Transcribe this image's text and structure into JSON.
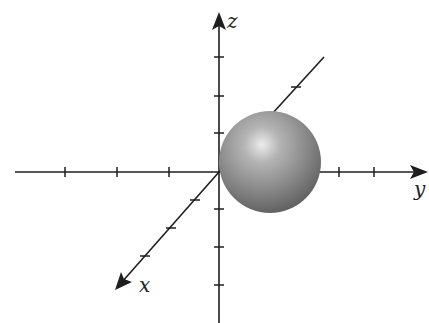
{
  "diagram": {
    "type": "3d-coordinate-axes",
    "labels": {
      "x": "x",
      "y": "y",
      "z": "z"
    },
    "colors": {
      "axis": "#1e1e1e",
      "sphere_highlight": "#e8e8e8",
      "sphere_mid": "#8a8a8a",
      "sphere_shadow": "#5a5a5a",
      "background": "#ffffff"
    },
    "origin": [
      219,
      172
    ],
    "axes": {
      "z": {
        "from": [
          219,
          323
        ],
        "to": [
          219,
          14
        ],
        "ticks_y": [
          57,
          96,
          133,
          209,
          247,
          285
        ]
      },
      "y": {
        "from": [
          15,
          172
        ],
        "to": [
          426,
          172
        ],
        "ticks_x": [
          65,
          117,
          169,
          339,
          374
        ]
      },
      "x": {
        "from": [
          219,
          172
        ],
        "to": [
          117,
          289
        ],
        "ticks": [
          [
            195,
            200
          ],
          [
            171,
            228
          ],
          [
            145,
            256
          ]
        ]
      },
      "back_x": {
        "from": [
          219,
          172
        ],
        "to": [
          324,
          57
        ],
        "ticks": [
          [
            296,
            87
          ],
          [
            272,
            115
          ]
        ]
      }
    },
    "sphere": {
      "cx": 270,
      "cy": 162,
      "r": 51,
      "description": "shaded sphere tangent to the xz-plane at origin, centered on positive y-axis"
    }
  }
}
